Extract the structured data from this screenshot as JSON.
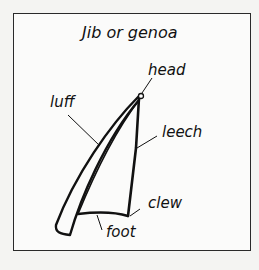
{
  "diagram": {
    "title": "Jib or genoa",
    "labels": {
      "head": "head",
      "luff": "luff",
      "leech": "leech",
      "clew": "clew",
      "foot": "foot"
    },
    "colors": {
      "ink": "#111111",
      "paper": "#fbfbfa",
      "background": "#f4f4f2"
    }
  }
}
